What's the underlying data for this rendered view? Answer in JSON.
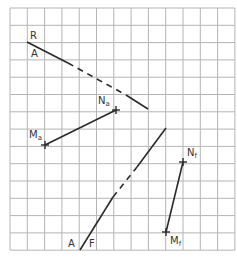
{
  "diagram": {
    "grid": {
      "columns": 13,
      "rows": 14,
      "line_color": "#b4b4b4"
    },
    "line_color": "#2a2a2a",
    "labels": {
      "R": "R",
      "A_top": "A",
      "Na_main": "N",
      "Na_sub": "a",
      "Ma_main": "M",
      "Ma_sub": "a",
      "Nf_main": "N",
      "Nf_sub": "f",
      "Mf_main": "M",
      "Mf_sub": "f",
      "A_bottom": "A",
      "F": "F"
    },
    "lines": [
      {
        "name": "trace-RA",
        "style": "solid-dashed-solid",
        "from_cell": [
          1,
          2
        ],
        "to_cell": [
          8,
          5.8
        ]
      },
      {
        "name": "segment-Ma-Na",
        "style": "solid",
        "from_cell": [
          2,
          7.9
        ],
        "to_cell": [
          6.1,
          5.9
        ]
      },
      {
        "name": "trace-AF",
        "style": "solid-dashed-solid",
        "from_cell": [
          4,
          14
        ],
        "to_cell": [
          9,
          7
        ]
      },
      {
        "name": "segment-Mf-Nf",
        "style": "solid",
        "from_cell": [
          9,
          12.9
        ],
        "to_cell": [
          10,
          8.9
        ]
      }
    ],
    "points": [
      {
        "name": "Na",
        "cell": [
          6.1,
          5.9
        ]
      },
      {
        "name": "Ma",
        "cell": [
          2,
          7.9
        ]
      },
      {
        "name": "Nf",
        "cell": [
          10,
          8.9
        ]
      },
      {
        "name": "Mf",
        "cell": [
          9,
          12.9
        ]
      }
    ]
  }
}
